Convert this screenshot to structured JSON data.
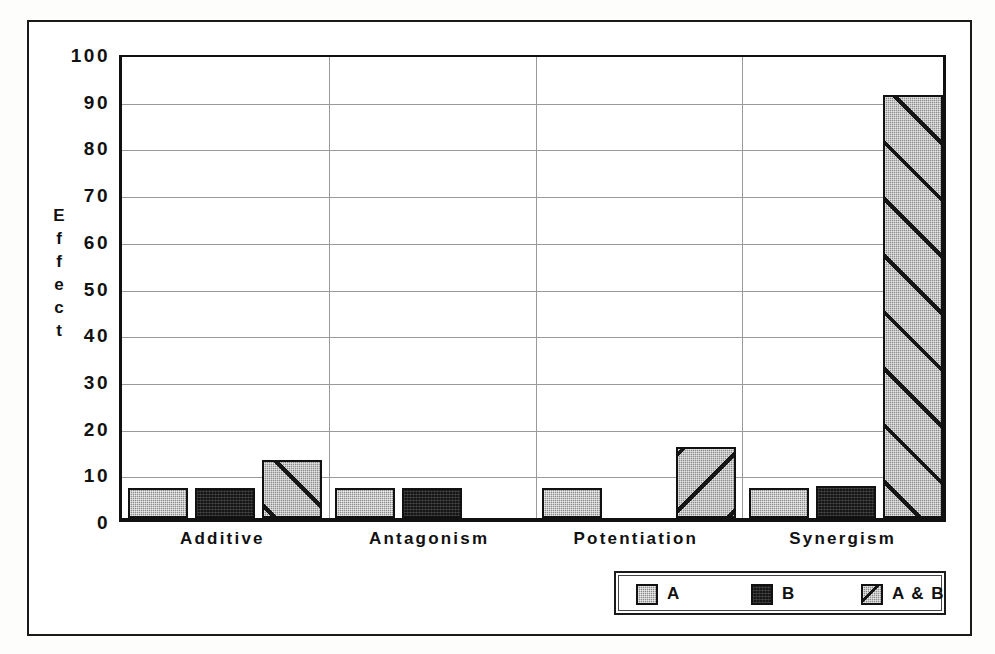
{
  "chart_data": {
    "type": "bar",
    "title": "",
    "xlabel": "",
    "ylabel": "Effect",
    "categories": [
      "Additive",
      "Antagonism",
      "Potentiation",
      "Synergism"
    ],
    "series": [
      {
        "name": "A",
        "values": [
          6.5,
          6.5,
          6.5,
          6.5
        ]
      },
      {
        "name": "B",
        "values": [
          6.5,
          6.5,
          0,
          6.8
        ]
      },
      {
        "name": "A & B",
        "values": [
          12.5,
          0,
          15.3,
          90.5
        ]
      }
    ],
    "ylim": [
      0,
      100
    ],
    "yticks": [
      0,
      10,
      20,
      30,
      40,
      50,
      60,
      70,
      80,
      90,
      100
    ],
    "ytick_labels": [
      "0",
      "10",
      "20",
      "30",
      "40",
      "50",
      "60",
      "70",
      "80",
      "90",
      "100"
    ],
    "grid": "horizontal-and-vertical",
    "legend_position": "bottom-right",
    "legend_entries": [
      "A",
      "B",
      "A & B"
    ],
    "colors": {
      "series_a": "#8c8c8c",
      "series_b": "#151515",
      "series_ab": "#8c8c8c",
      "axis": "#111111",
      "gridline": "#9a9a9a",
      "background": "#ffffff"
    },
    "fill_patterns": {
      "series_a": "fine-stipple-gray",
      "series_b": "solid-black",
      "series_ab": "gray-stipple-with-diagonal-hatch"
    }
  },
  "y_axis_title_letters": [
    "E",
    "f",
    "f",
    "e",
    "c",
    "t"
  ]
}
